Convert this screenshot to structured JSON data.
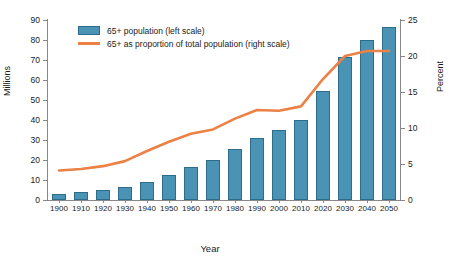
{
  "chart_data": {
    "type": "bar",
    "title": "",
    "xlabel": "Year",
    "ylabel": "Millions",
    "ylabel_right": "Percent",
    "categories": [
      "1900",
      "1910",
      "1920",
      "1930",
      "1940",
      "1950",
      "1960",
      "1970",
      "1980",
      "1990",
      "2000",
      "2010",
      "2020",
      "2030",
      "2040",
      "2050"
    ],
    "values": [
      3.1,
      4.0,
      4.9,
      6.6,
      9.0,
      12.3,
      16.6,
      20.1,
      25.5,
      31.2,
      35.0,
      40.2,
      54.6,
      71.5,
      80.1,
      86.7
    ],
    "series": [
      {
        "name": "65+ population (left scale)",
        "type": "bar",
        "axis": "left",
        "color": "#4a93b5",
        "values": [
          3.1,
          4.0,
          4.9,
          6.6,
          9.0,
          12.3,
          16.6,
          20.1,
          25.5,
          31.2,
          35.0,
          40.2,
          54.6,
          71.5,
          80.1,
          86.7
        ]
      },
      {
        "name": "65+ as proportion of total population (right scale)",
        "type": "line",
        "axis": "right",
        "color": "#ec8145",
        "values": [
          4.1,
          4.3,
          4.7,
          5.4,
          6.8,
          8.1,
          9.2,
          9.8,
          11.3,
          12.5,
          12.4,
          13.0,
          16.8,
          20.0,
          20.7,
          20.7
        ]
      }
    ],
    "ylim": [
      0,
      90
    ],
    "yticks": [
      0,
      10,
      20,
      30,
      40,
      50,
      60,
      70,
      80,
      90
    ],
    "ylim_right": [
      0,
      25
    ],
    "yticks_right": [
      0,
      5,
      10,
      15,
      20,
      25
    ],
    "grid": false,
    "legend_position": "upper left",
    "legend": [
      "65+ population (left scale)",
      "65+ as proportion of total population (right scale)"
    ]
  },
  "axes": {
    "left_title": "Millions",
    "right_title": "Percent",
    "x_title": "Year"
  },
  "colors": {
    "bar_fill": "#4a93b5",
    "bar_edge": "#2d6d8c",
    "line": "#ec8145",
    "axis": "#888888",
    "text": "#1a1a1a",
    "background": "#ffffff"
  }
}
